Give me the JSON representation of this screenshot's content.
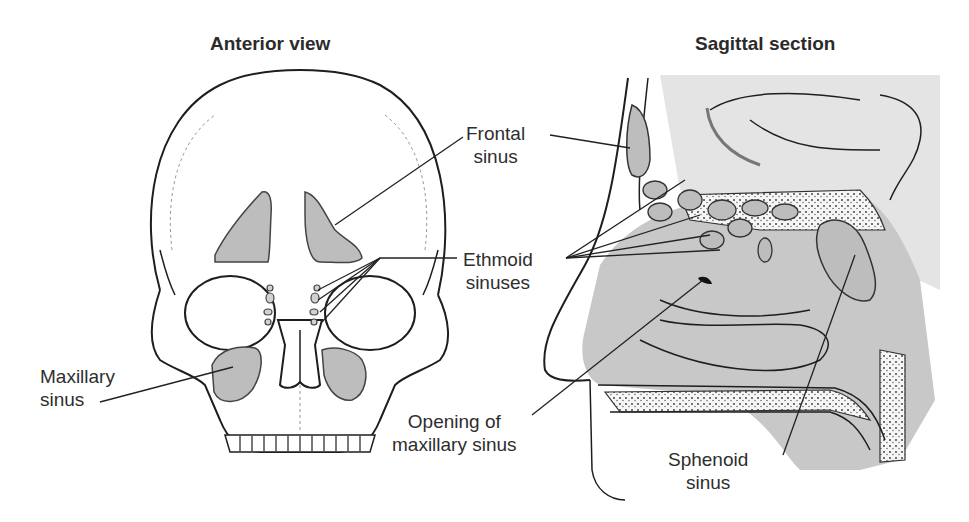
{
  "titles": {
    "anterior": "Anterior view",
    "sagittal": "Sagittal section"
  },
  "labels": {
    "frontal": {
      "line1": "Frontal",
      "line2": "sinus"
    },
    "ethmoid": {
      "line1": "Ethmoid",
      "line2": "sinuses"
    },
    "maxillary": {
      "line1": "Maxillary",
      "line2": "sinus"
    },
    "opening": {
      "line1": "Opening of",
      "line2": "maxillary sinus"
    },
    "sphenoid": {
      "line1": "Sphenoid",
      "line2": "sinus"
    }
  },
  "colors": {
    "sinus_fill": "#bdbdbd",
    "tissue_fill": "#c8c8c8",
    "brain_fill": "#e4e4e4",
    "line": "#1e1e1e",
    "background": "#ffffff"
  }
}
